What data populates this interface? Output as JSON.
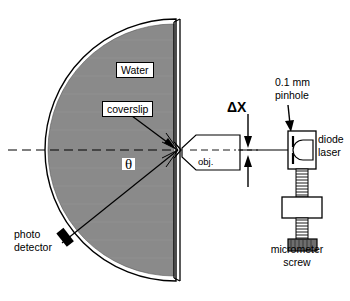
{
  "figure": {
    "labels": {
      "water": "Water",
      "coverslip": "coverslip",
      "theta": "θ",
      "objective": "obj.",
      "delta_x": "ΔX",
      "pinhole": "0.1 mm\npinhole",
      "pinhole_line1": "0.1 mm",
      "pinhole_line2": "pinhole",
      "diode_laser_line1": "diode",
      "diode_laser_line2": "laser",
      "micrometer_line1": "micrometer",
      "micrometer_line2": "screw",
      "photodetector_line1": "photo",
      "photodetector_line2": "detector"
    },
    "colors": {
      "water_fill": "#8a8a8a",
      "outline": "#000000",
      "background": "#ffffff",
      "knob_fill": "#6e6e6e",
      "detector_fill": "#000000"
    },
    "geometry": {
      "focus_point_x": 178,
      "focus_point_y": 150,
      "optical_axis_y": 150,
      "hemisphere_radius": 131,
      "scatter_angle_deg": 40
    },
    "components": [
      "hemispherical water cell",
      "coverslip",
      "microscope objective",
      "pinhole",
      "diode laser",
      "micrometer screw",
      "photo detector"
    ]
  }
}
